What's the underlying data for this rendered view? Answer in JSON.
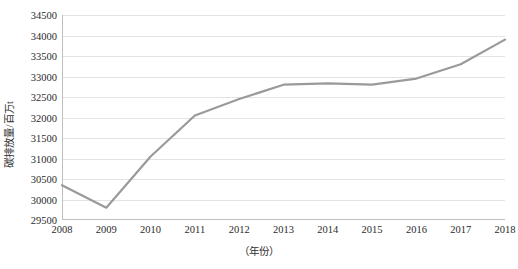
{
  "chart_data": {
    "type": "line",
    "title": "",
    "subtitle": "",
    "xlabel": "（年份）",
    "ylabel": "碳排放量/百万t",
    "categories": [
      "2008",
      "2009",
      "2010",
      "2011",
      "2012",
      "2013",
      "2014",
      "2015",
      "2016",
      "2017",
      "2018"
    ],
    "x": [
      2008,
      2009,
      2010,
      2011,
      2012,
      2013,
      2014,
      2015,
      2016,
      2017,
      2018
    ],
    "values": [
      30350,
      29800,
      31050,
      32050,
      32450,
      32800,
      32830,
      32800,
      32950,
      33300,
      33900
    ],
    "series": [
      {
        "name": "碳排放量",
        "values": [
          30350,
          29800,
          31050,
          32050,
          32450,
          32800,
          32830,
          32800,
          32950,
          33300,
          33900
        ]
      }
    ],
    "ylim": [
      29500,
      34500
    ],
    "ytick_step": 500,
    "yticks": [
      29500,
      30000,
      30500,
      31000,
      31500,
      32000,
      32500,
      33000,
      33500,
      34000,
      34500
    ],
    "ytick_labels": [
      "29500",
      "30000",
      "30500",
      "31000",
      "31500",
      "32000",
      "32500",
      "33000",
      "33500",
      "34000",
      "34500"
    ],
    "xtick_labels": [
      "2008",
      "2009",
      "2010",
      "2011",
      "2012",
      "2013",
      "2014",
      "2015",
      "2016",
      "2017",
      "2018"
    ],
    "grid": true,
    "grid_axis": "y",
    "legend": false,
    "legend_position": "none",
    "line_color": "#9a9a9a",
    "line_width": 2.2,
    "markers": false,
    "gridline_color": "#e3e3e3",
    "axis_color": "#bfbfbf",
    "background_color": "#ffffff",
    "text_color": "#2b2b2b"
  }
}
